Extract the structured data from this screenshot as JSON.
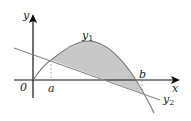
{
  "diagram": {
    "type": "area-between-curves",
    "axes": {
      "x_label": "x",
      "y_label": "y",
      "origin_label": "0"
    },
    "curves": [
      {
        "name": "y1",
        "label_main": "y",
        "label_sub": "1",
        "kind": "concave curve"
      },
      {
        "name": "y2",
        "label_main": "y",
        "label_sub": "2",
        "kind": "straight line, decreasing"
      }
    ],
    "points": [
      {
        "name": "a",
        "label": "a",
        "description": "left intersection of y1 and y2"
      },
      {
        "name": "b",
        "label": "b",
        "description": "right intersection of y1 and y2"
      }
    ],
    "shaded_region": "area between y1 and y2 from a to b",
    "colors": {
      "axis": "#111111",
      "curve": "#777777",
      "line": "#888888",
      "shade": "#c8c8c8",
      "dash": "#999999"
    }
  }
}
